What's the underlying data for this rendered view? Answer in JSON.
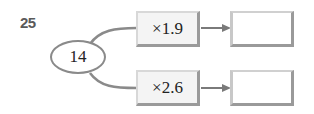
{
  "problem": {
    "number": "25",
    "start_value": "14",
    "branches": [
      {
        "operator": "×1.9",
        "result": ""
      },
      {
        "operator": "×2.6",
        "result": ""
      }
    ]
  },
  "colors": {
    "line": "#8a8a8a",
    "box_fill": "#f4f4f4",
    "box_shadow": "#9a9a9a",
    "text": "#222222",
    "number": "#5a5a5a"
  }
}
